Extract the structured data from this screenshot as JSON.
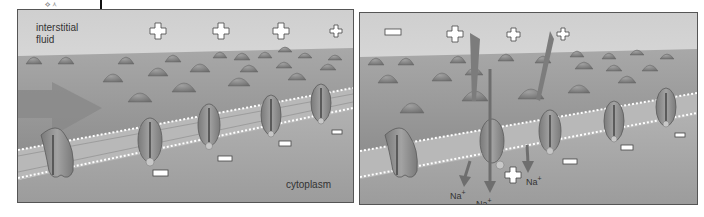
{
  "figure": {
    "panels": [
      {
        "id": "resting",
        "labels": {
          "outside": [
            "interstitial",
            "fluid"
          ],
          "inside": "cytoplasm"
        },
        "outside_charges": [
          "+",
          "+",
          "+",
          "+"
        ],
        "inside_charges": [
          "-",
          "-",
          "-",
          "-"
        ],
        "has_arrow": true
      },
      {
        "id": "depolarizing",
        "outside_charges": [
          "-",
          "+",
          "+",
          "+"
        ],
        "inside_charges": [
          "+",
          "-",
          "-",
          "-"
        ],
        "ion_labels": [
          "Na",
          "Na",
          "Na"
        ],
        "ion_superscript": "+"
      }
    ],
    "colors": {
      "background": "#ffffff",
      "fluid_top": "#e4e4e4",
      "membrane": "#9a9a9a",
      "protein": "#8c8c8c",
      "cytoplasm": "#a9a9a9",
      "charge_fill": "#ffffff"
    }
  }
}
